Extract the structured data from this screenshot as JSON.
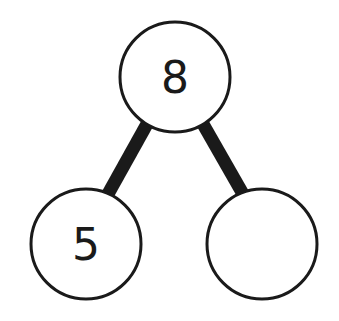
{
  "diagram": {
    "type": "number-bond",
    "whole": {
      "label": "8"
    },
    "parts": [
      {
        "label": "5"
      },
      {
        "label": ""
      }
    ],
    "colors": {
      "stroke": "#1a1a1a",
      "fill": "#ffffff"
    }
  }
}
